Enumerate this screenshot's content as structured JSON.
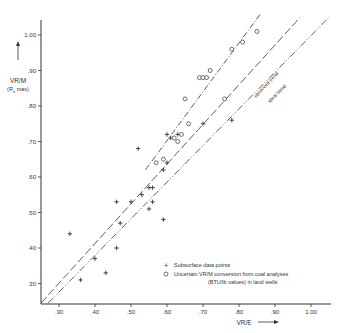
{
  "chart_data": {
    "type": "scatter",
    "title": "",
    "xlabel": "VR/E",
    "ylabel": "VR/M",
    "ylabel_sub": "(R0 max)",
    "xlim": [
      0.25,
      1.05
    ],
    "ylim": [
      0.25,
      1.04
    ],
    "x_ticks": [
      ".30",
      ".40",
      ".50",
      ".60",
      ".70",
      ".80",
      ".90",
      "1.00"
    ],
    "y_ticks": [
      "1.00",
      ".90",
      ".80",
      ".70",
      ".60",
      ".50",
      ".40",
      ".30"
    ],
    "x_tick_values": [
      0.3,
      0.4,
      0.5,
      0.6,
      0.7,
      0.8,
      0.9,
      1.0
    ],
    "y_tick_values": [
      1.0,
      0.9,
      0.8,
      0.7,
      0.6,
      0.5,
      0.4,
      0.3
    ],
    "grid": false,
    "legend_position": "lower right",
    "series": [
      {
        "name": "Subsurface data points",
        "marker": "+",
        "points": [
          [
            0.33,
            0.44
          ],
          [
            0.36,
            0.31
          ],
          [
            0.4,
            0.37
          ],
          [
            0.43,
            0.33
          ],
          [
            0.46,
            0.4
          ],
          [
            0.46,
            0.53
          ],
          [
            0.47,
            0.47
          ],
          [
            0.5,
            0.53
          ],
          [
            0.52,
            0.68
          ],
          [
            0.53,
            0.55
          ],
          [
            0.55,
            0.57
          ],
          [
            0.55,
            0.51
          ],
          [
            0.56,
            0.57
          ],
          [
            0.56,
            0.53
          ],
          [
            0.59,
            0.48
          ],
          [
            0.59,
            0.62
          ],
          [
            0.6,
            0.64
          ],
          [
            0.6,
            0.72
          ],
          [
            0.61,
            0.71
          ],
          [
            0.63,
            0.72
          ],
          [
            0.7,
            0.75
          ],
          [
            0.78,
            0.76
          ]
        ]
      },
      {
        "name": "Uncertain VR/M conversion from coal analyses (BTU/lb values) in land wells",
        "marker": "o",
        "points": [
          [
            0.57,
            0.64
          ],
          [
            0.59,
            0.65
          ],
          [
            0.62,
            0.71
          ],
          [
            0.63,
            0.7
          ],
          [
            0.64,
            0.72
          ],
          [
            0.65,
            0.82
          ],
          [
            0.66,
            0.75
          ],
          [
            0.69,
            0.88
          ],
          [
            0.7,
            0.88
          ],
          [
            0.71,
            0.88
          ],
          [
            0.72,
            0.9
          ],
          [
            0.76,
            0.82
          ],
          [
            0.78,
            0.96
          ],
          [
            0.81,
            0.98
          ],
          [
            0.85,
            1.01
          ]
        ]
      }
    ],
    "lines": [
      {
        "name": "",
        "style": "dash-dot",
        "from": [
          0.54,
          0.62
        ],
        "to": [
          0.86,
          1.06
        ]
      },
      {
        "name": "observed trend",
        "style": "long-dash",
        "from": [
          0.25,
          0.245
        ],
        "to": [
          0.97,
          1.05
        ]
      },
      {
        "name": "ideal trend",
        "style": "dash-dot-dot",
        "from": [
          0.27,
          0.245
        ],
        "to": [
          1.05,
          1.05
        ]
      }
    ],
    "annotations": [
      "observed trend",
      "ideal trend"
    ]
  },
  "legend": {
    "items": [
      {
        "symbol": "+",
        "label": "Subsurface data points"
      },
      {
        "symbol": "o",
        "label": "Uncertain VR/M conversion from coal analyses",
        "label2": "(BTU/lb values) in land wells"
      }
    ]
  },
  "axes": {
    "x_label": "VR/E",
    "y_label": "VR/M",
    "y_label_sub": "(R",
    "y_label_sub_idx": "o",
    "y_label_sub_end": " max)"
  },
  "line_labels": {
    "observed": "observed trend",
    "ideal": "ideal trend"
  },
  "colors": {
    "ink": "#333333",
    "background": "#ffffff"
  }
}
